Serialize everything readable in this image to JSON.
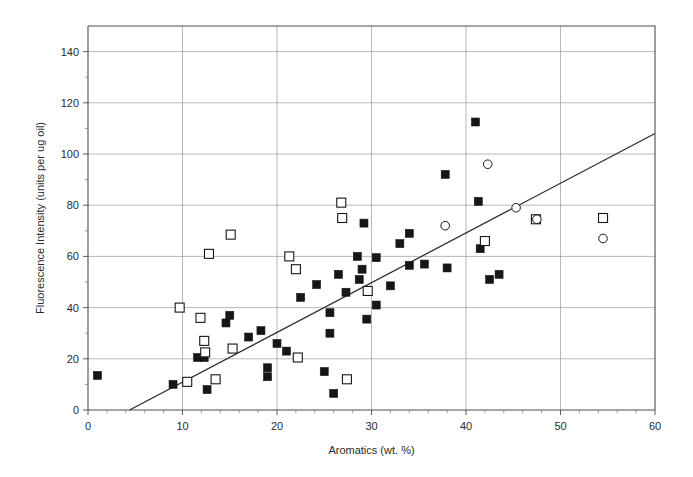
{
  "chart_data": {
    "type": "scatter",
    "title": "",
    "xlabel": "Aromatics  (wt. %)",
    "ylabel": "Fluorescence Intensity (units per ug oil)",
    "xlim": [
      0,
      60
    ],
    "ylim": [
      0,
      150
    ],
    "xticks": [
      0,
      10,
      20,
      30,
      40,
      50,
      60
    ],
    "yticks": [
      0,
      20,
      40,
      60,
      80,
      100,
      120,
      140
    ],
    "xtick_labels": [
      "0",
      "10",
      "20",
      "30",
      "40",
      "50",
      "60"
    ],
    "ytick_labels": [
      "0",
      "20",
      "40",
      "60",
      "80",
      "100",
      "120",
      "140"
    ],
    "grid": true,
    "legend": "none",
    "series": [
      {
        "name": "filled-square",
        "marker": "filled square",
        "color": "#161616",
        "points": [
          [
            1.0,
            13.5
          ],
          [
            9.0,
            10.0
          ],
          [
            11.6,
            20.5
          ],
          [
            12.3,
            20.5
          ],
          [
            12.6,
            8.0
          ],
          [
            14.6,
            34.0
          ],
          [
            15.0,
            37.0
          ],
          [
            17.0,
            28.5
          ],
          [
            18.3,
            31.0
          ],
          [
            19.0,
            16.5
          ],
          [
            19.0,
            13.0
          ],
          [
            20.0,
            26.0
          ],
          [
            21.0,
            23.0
          ],
          [
            22.5,
            44.0
          ],
          [
            24.2,
            49.0
          ],
          [
            25.0,
            15.0
          ],
          [
            25.6,
            38.0
          ],
          [
            25.6,
            30.0
          ],
          [
            26.0,
            6.5
          ],
          [
            26.5,
            53.0
          ],
          [
            27.3,
            46.0
          ],
          [
            28.5,
            60.0
          ],
          [
            28.7,
            51.0
          ],
          [
            29.0,
            55.0
          ],
          [
            29.2,
            73.0
          ],
          [
            29.5,
            35.5
          ],
          [
            30.5,
            59.5
          ],
          [
            30.5,
            41.0
          ],
          [
            32.0,
            48.5
          ],
          [
            33.0,
            65.0
          ],
          [
            34.0,
            69.0
          ],
          [
            34.0,
            56.5
          ],
          [
            35.6,
            57.0
          ],
          [
            37.8,
            92.0
          ],
          [
            38.0,
            55.5
          ],
          [
            41.0,
            112.5
          ],
          [
            41.3,
            81.5
          ],
          [
            41.5,
            63.0
          ],
          [
            42.5,
            51.0
          ],
          [
            43.5,
            53.0
          ]
        ]
      },
      {
        "name": "open-square",
        "marker": "open square",
        "color": "#ffffff",
        "points": [
          [
            9.7,
            40.0
          ],
          [
            10.5,
            11.0
          ],
          [
            11.9,
            36.0
          ],
          [
            12.3,
            27.0
          ],
          [
            12.4,
            22.5
          ],
          [
            12.8,
            61.0
          ],
          [
            13.5,
            12.0
          ],
          [
            15.1,
            68.5
          ],
          [
            15.3,
            24.0
          ],
          [
            21.3,
            60.0
          ],
          [
            22.0,
            55.0
          ],
          [
            22.2,
            20.5
          ],
          [
            26.8,
            81.0
          ],
          [
            26.9,
            75.0
          ],
          [
            27.4,
            12.0
          ],
          [
            29.6,
            46.5
          ],
          [
            42.0,
            66.0
          ],
          [
            47.4,
            74.5
          ],
          [
            54.5,
            75.0
          ]
        ]
      },
      {
        "name": "open-circle",
        "marker": "open circle",
        "color": "#ffffff",
        "points": [
          [
            37.8,
            72.0
          ],
          [
            42.3,
            96.0
          ],
          [
            45.3,
            79.0
          ],
          [
            47.5,
            74.5
          ],
          [
            54.5,
            67.0
          ]
        ]
      }
    ],
    "fit_line": {
      "name": "regression-line",
      "x_start": 4.4,
      "y_start": 0,
      "x_end": 60,
      "y_end": 108
    }
  }
}
